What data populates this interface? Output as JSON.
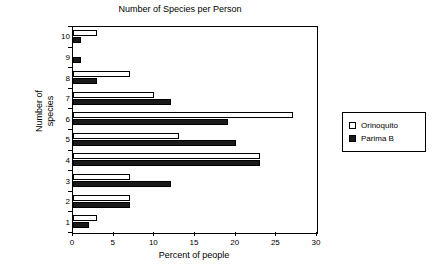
{
  "chart_data": {
    "type": "bar",
    "orientation": "horizontal",
    "title": "Number of Species per Person",
    "xlabel": "Percent of people",
    "ylabel": "Number of\nspecies",
    "categories": [
      "1",
      "2",
      "3",
      "4",
      "5",
      "6",
      "7",
      "8",
      "9",
      "10"
    ],
    "category_order_top_to_bottom": [
      "10",
      "9",
      "8",
      "7",
      "6",
      "5",
      "4",
      "3",
      "2",
      "1"
    ],
    "series": [
      {
        "name": "Orinoquito",
        "color": "#ffffff",
        "values": [
          3,
          7,
          7,
          23,
          13,
          27,
          10,
          7,
          0,
          3
        ]
      },
      {
        "name": "Parima B",
        "color": "#1a1a1a",
        "values": [
          2,
          7,
          12,
          23,
          20,
          19,
          12,
          3,
          1,
          1
        ]
      }
    ],
    "xlim": [
      0,
      30
    ],
    "xticks": [
      0,
      5,
      10,
      15,
      20,
      25,
      30
    ],
    "xtick_labels": [
      "0",
      "5",
      "10",
      "15",
      "20",
      "25",
      "30"
    ],
    "grid": false,
    "legend_position": "right"
  },
  "legend": {
    "items": [
      {
        "label": "Orinoquito",
        "swatch": "swatch-hollow"
      },
      {
        "label": "Parima B",
        "swatch": "swatch-filled"
      }
    ]
  }
}
